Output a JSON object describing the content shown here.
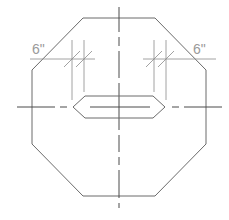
{
  "drawing": {
    "title": "",
    "shape": "octagon-with-center-slot",
    "dimensions": [
      {
        "id": "left",
        "label": "6\""
      },
      {
        "id": "right",
        "label": "6\""
      }
    ]
  },
  "colors": {
    "outline": "#6b6b6b",
    "dimension": "#8a8a8a",
    "centerline": "#4a4a4a",
    "label": "#9a9a9a",
    "background": "#ffffff"
  }
}
